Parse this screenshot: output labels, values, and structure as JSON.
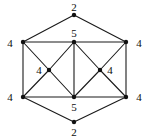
{
  "figure": {
    "type": "graph-diagram",
    "background_color": "#ffffff",
    "edge_color": "#1a1a1a",
    "vertex_color": "#111111",
    "label_color": "#0d0d0d",
    "edge_width": 1.1,
    "vertex_radius": 2.2
  },
  "nodes": [
    {
      "id": "top",
      "label": "2",
      "x": 74,
      "y": 15,
      "label_x": 74,
      "label_y": 7,
      "degree": 2
    },
    {
      "id": "upper-left",
      "label": "4",
      "x": 23,
      "y": 42,
      "label_x": 10,
      "label_y": 43,
      "degree": 4
    },
    {
      "id": "upper-center",
      "label": "5",
      "x": 74,
      "y": 42,
      "label_x": 74,
      "label_y": 33,
      "degree": 5
    },
    {
      "id": "upper-right",
      "label": "4",
      "x": 126,
      "y": 42,
      "label_x": 139,
      "label_y": 43,
      "degree": 4
    },
    {
      "id": "inner-left",
      "label": "4",
      "x": 49,
      "y": 70,
      "label_x": 39,
      "label_y": 70,
      "degree": 4
    },
    {
      "id": "inner-right",
      "label": "4",
      "x": 100,
      "y": 70,
      "label_x": 110,
      "label_y": 70,
      "degree": 4
    },
    {
      "id": "lower-left",
      "label": "4",
      "x": 23,
      "y": 97,
      "label_x": 10,
      "label_y": 97,
      "degree": 4
    },
    {
      "id": "lower-center",
      "label": "5",
      "x": 74,
      "y": 97,
      "label_x": 74,
      "label_y": 107,
      "degree": 5
    },
    {
      "id": "lower-right",
      "label": "4",
      "x": 126,
      "y": 97,
      "label_x": 139,
      "label_y": 97,
      "degree": 4
    },
    {
      "id": "bottom",
      "label": "2",
      "x": 74,
      "y": 122,
      "label_x": 74,
      "label_y": 132,
      "degree": 2
    }
  ],
  "edges": [
    {
      "from": "top",
      "to": "upper-left"
    },
    {
      "from": "top",
      "to": "upper-right"
    },
    {
      "from": "upper-left",
      "to": "upper-center"
    },
    {
      "from": "upper-center",
      "to": "upper-right"
    },
    {
      "from": "upper-left",
      "to": "lower-left"
    },
    {
      "from": "upper-right",
      "to": "lower-right"
    },
    {
      "from": "upper-left",
      "to": "inner-left"
    },
    {
      "from": "upper-center",
      "to": "inner-left"
    },
    {
      "from": "lower-left",
      "to": "inner-left"
    },
    {
      "from": "lower-center",
      "to": "inner-left"
    },
    {
      "from": "upper-center",
      "to": "inner-right"
    },
    {
      "from": "upper-right",
      "to": "inner-right"
    },
    {
      "from": "lower-center",
      "to": "inner-right"
    },
    {
      "from": "lower-right",
      "to": "inner-right"
    },
    {
      "from": "upper-center",
      "to": "lower-center"
    },
    {
      "from": "lower-left",
      "to": "lower-center"
    },
    {
      "from": "lower-center",
      "to": "lower-right"
    },
    {
      "from": "lower-left",
      "to": "bottom"
    },
    {
      "from": "lower-right",
      "to": "bottom"
    }
  ]
}
